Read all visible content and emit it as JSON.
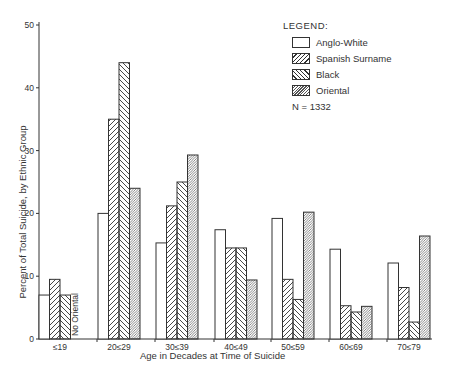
{
  "chart_data": {
    "type": "bar",
    "title": "",
    "xlabel": "Age in Decades at Time of Suicide",
    "ylabel": "Percent of Total Suicide, by Ethnic Group",
    "ylim": [
      0,
      50
    ],
    "yticks": [
      0,
      10,
      20,
      30,
      40,
      50
    ],
    "grid": false,
    "legend_position": "top-right",
    "legend_title": "LEGEND:",
    "categories": [
      "≤19",
      "20≤29",
      "30≤39",
      "40≤49",
      "50≤59",
      "60≤69",
      "70≤79"
    ],
    "series": [
      {
        "name": "Anglo-White",
        "pattern": "empty",
        "values": [
          7,
          20,
          15.3,
          17.4,
          19.2,
          14.3,
          12.1
        ]
      },
      {
        "name": "Spanish Surname",
        "pattern": "hatch-forward",
        "values": [
          9.5,
          35,
          21.2,
          14.5,
          9.5,
          5.3,
          8.2
        ]
      },
      {
        "name": "Black",
        "pattern": "hatch-backward",
        "values": [
          7,
          44,
          25,
          14.5,
          6.3,
          4.3,
          2.7
        ]
      },
      {
        "name": "Oriental",
        "pattern": "hatch-dense",
        "values": [
          null,
          24,
          29.3,
          9.4,
          20.2,
          5.2,
          16.4
        ]
      }
    ],
    "annotations": [
      {
        "text": "No Oriental",
        "category": "≤19",
        "orientation": "vertical"
      },
      {
        "text": "N = 1332",
        "location": "legend"
      }
    ]
  },
  "legend": {
    "title": "LEGEND:",
    "items": [
      {
        "label": "Anglo-White"
      },
      {
        "label": "Spanish Surname"
      },
      {
        "label": "Black"
      },
      {
        "label": "Oriental"
      }
    ],
    "n_label": "N = 1332"
  },
  "axes": {
    "xlabel": "Age in Decades at Time of Suicide",
    "ylabel": "Percent of Total Suicide, by Ethnic Group"
  },
  "colors": {
    "ink": "#333333",
    "background": "#ffffff"
  }
}
